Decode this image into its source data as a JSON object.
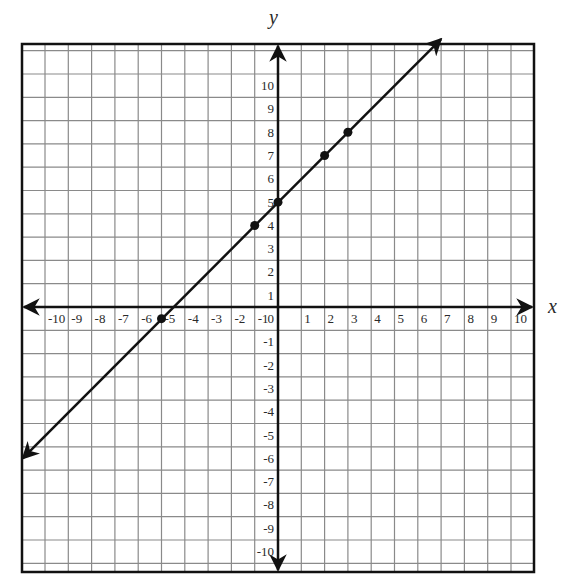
{
  "chart_data": {
    "type": "line",
    "title": "",
    "xlabel": "x",
    "ylabel": "y",
    "xlim": [
      -10,
      10
    ],
    "ylim": [
      -10,
      10
    ],
    "grid": true,
    "x_ticks": [
      -10,
      -9,
      -8,
      -7,
      -6,
      -5,
      -4,
      -3,
      -2,
      -1,
      0,
      1,
      2,
      3,
      4,
      5,
      6,
      7,
      8,
      9,
      10
    ],
    "y_ticks": [
      -10,
      -9,
      -8,
      -7,
      -6,
      -5,
      -4,
      -3,
      -2,
      -1,
      0,
      1,
      2,
      3,
      4,
      5,
      6,
      7,
      8,
      9,
      10
    ],
    "line": {
      "description": "Straight line with arrows at both ends, slope 1, y-intercept 4.5",
      "slope": 1,
      "intercept": 4.5,
      "endpoints": [
        [
          -11,
          -6.5
        ],
        [
          7,
          11.5
        ]
      ]
    },
    "points": [
      {
        "x": -5,
        "y": -0.5
      },
      {
        "x": -1,
        "y": 3.5
      },
      {
        "x": 0,
        "y": 4.5
      },
      {
        "x": 2,
        "y": 6.5
      },
      {
        "x": 3,
        "y": 7.5
      }
    ]
  },
  "labels": {
    "x_axis": "x",
    "y_axis": "y"
  },
  "colors": {
    "grid": "#8a8a8a",
    "axis": "#111111",
    "line": "#111111",
    "border": "#111111"
  }
}
